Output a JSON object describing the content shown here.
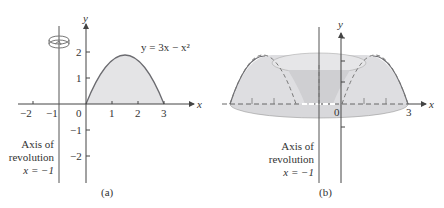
{
  "panel_a": {
    "caption": "(a)",
    "curve_label": "y = 3x − x²",
    "x_axis_label": "x",
    "y_axis_label": "y",
    "x_ticks": [
      "−2",
      "−1",
      "0",
      "1",
      "2",
      "3"
    ],
    "y_ticks": [
      "2",
      "1",
      "−1",
      "−2"
    ],
    "axis_label_line1": "Axis of",
    "axis_label_line2": "revolution",
    "axis_label_line3": "x = −1"
  },
  "panel_b": {
    "caption": "(b)",
    "x_axis_label": "x",
    "y_axis_label": "y",
    "origin_label": "0",
    "x_end_label": "3",
    "axis_label_line1": "Axis of",
    "axis_label_line2": "revolution",
    "axis_label_line3": "x = −1"
  },
  "colors": {
    "fill": "#e4e4e6",
    "solid_fill": "#d6d6d9",
    "curve": "#6b6b70",
    "axis": "#444444"
  }
}
